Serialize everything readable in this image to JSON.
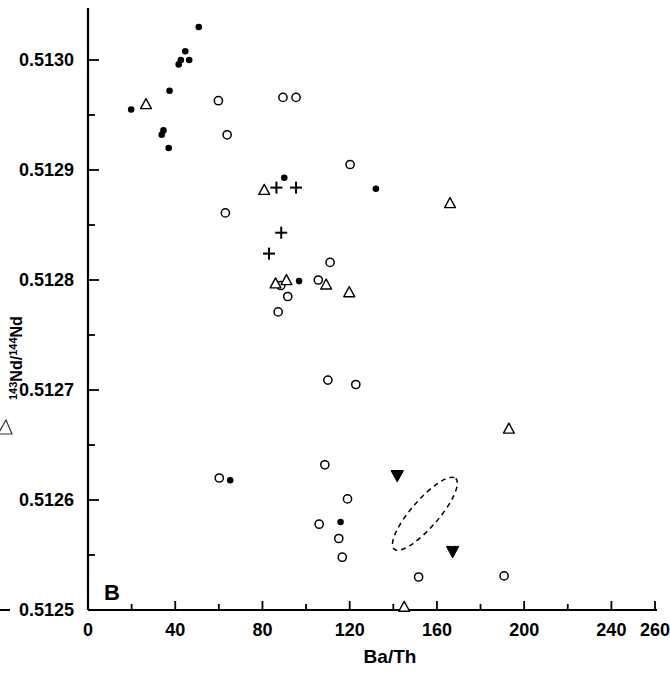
{
  "figure": {
    "panel_label": "B",
    "background_color": "#ffffff",
    "ink_color": "#000000"
  },
  "chart_data": {
    "type": "scatter",
    "title": "",
    "subtitle": "",
    "panel": "B",
    "xlabel": "Ba/Th",
    "ylabel": "143Nd/144Nd",
    "ylabel_parts": {
      "sup1": "143",
      "mid": "Nd/",
      "sup2": "144",
      "end": "Nd"
    },
    "xlim": [
      0,
      260
    ],
    "ylim": [
      0.5125,
      0.51305
    ],
    "grid": false,
    "legend": null,
    "legend_position": "none",
    "xticks": [
      0,
      20,
      40,
      60,
      80,
      100,
      120,
      140,
      160,
      180,
      200,
      220,
      240,
      260
    ],
    "xticklabels": [
      "0",
      "",
      "40",
      "",
      "80",
      "",
      "120",
      "",
      "160",
      "",
      "200",
      "",
      "240",
      "260"
    ],
    "xtick_major": [
      0,
      40,
      80,
      120,
      160,
      200,
      240,
      260
    ],
    "yticks": [
      0.5125,
      0.51255,
      0.5126,
      0.51265,
      0.5127,
      0.51275,
      0.5128,
      0.51285,
      0.5129,
      0.51295,
      0.513
    ],
    "yticklabels": [
      "0.5125",
      "",
      "0.5126",
      "",
      "0.5127",
      "",
      "0.5128",
      "",
      "0.5129",
      "",
      "0.5130"
    ],
    "ytick_major": [
      0.5125,
      0.5126,
      0.5127,
      0.5128,
      0.5129,
      0.513
    ],
    "series": [
      {
        "name": "filled-circle",
        "marker": "filled-circle",
        "points": [
          {
            "x": 19.8,
            "y": 0.512955
          },
          {
            "x": 33.8,
            "y": 0.512932
          },
          {
            "x": 34.6,
            "y": 0.512936
          },
          {
            "x": 37.4,
            "y": 0.512972
          },
          {
            "x": 41.6,
            "y": 0.512996
          },
          {
            "x": 42.6,
            "y": 0.513
          },
          {
            "x": 44.6,
            "y": 0.513008
          },
          {
            "x": 46.4,
            "y": 0.513
          },
          {
            "x": 50.8,
            "y": 0.51303
          },
          {
            "x": 37.0,
            "y": 0.51292
          },
          {
            "x": 65.2,
            "y": 0.512618
          },
          {
            "x": 90.0,
            "y": 0.512893
          },
          {
            "x": 96.8,
            "y": 0.512799
          },
          {
            "x": 132.0,
            "y": 0.512883
          },
          {
            "x": 115.8,
            "y": 0.51258
          }
        ]
      },
      {
        "name": "open-circle",
        "marker": "open-circle",
        "points": [
          {
            "x": 59.8,
            "y": 0.512963
          },
          {
            "x": 63.8,
            "y": 0.512932
          },
          {
            "x": 63.0,
            "y": 0.512861
          },
          {
            "x": 89.4,
            "y": 0.512966
          },
          {
            "x": 95.4,
            "y": 0.512966
          },
          {
            "x": 120.2,
            "y": 0.512905
          },
          {
            "x": 105.6,
            "y": 0.5128
          },
          {
            "x": 111.0,
            "y": 0.512816
          },
          {
            "x": 88.4,
            "y": 0.512795
          },
          {
            "x": 87.2,
            "y": 0.512771
          },
          {
            "x": 91.6,
            "y": 0.512785
          },
          {
            "x": 110.0,
            "y": 0.512709
          },
          {
            "x": 122.8,
            "y": 0.512705
          },
          {
            "x": 60.2,
            "y": 0.51262
          },
          {
            "x": 108.6,
            "y": 0.512632
          },
          {
            "x": 119.0,
            "y": 0.512601
          },
          {
            "x": 106.0,
            "y": 0.512578
          },
          {
            "x": 115.0,
            "y": 0.512565
          },
          {
            "x": 116.6,
            "y": 0.512548
          },
          {
            "x": 151.6,
            "y": 0.51253
          },
          {
            "x": 190.8,
            "y": 0.512531
          }
        ]
      },
      {
        "name": "open-triangle",
        "marker": "open-triangle",
        "points": [
          {
            "x": 26.6,
            "y": 0.51296
          },
          {
            "x": 80.8,
            "y": 0.512882
          },
          {
            "x": 86.0,
            "y": 0.512797
          },
          {
            "x": 91.0,
            "y": 0.5128
          },
          {
            "x": 109.2,
            "y": 0.512796
          },
          {
            "x": 119.8,
            "y": 0.512789
          },
          {
            "x": 166.0,
            "y": 0.51287
          },
          {
            "x": 193.0,
            "y": 0.512665
          },
          {
            "x": 145.0,
            "y": 0.512503
          }
        ]
      },
      {
        "name": "plus",
        "marker": "plus",
        "points": [
          {
            "x": 86.4,
            "y": 0.512884
          },
          {
            "x": 95.4,
            "y": 0.512884
          },
          {
            "x": 88.6,
            "y": 0.512843
          },
          {
            "x": 83.0,
            "y": 0.512824
          }
        ]
      },
      {
        "name": "filled-down-triangle",
        "marker": "filled-down-triangle",
        "points": [
          {
            "x": 141.8,
            "y": 0.512622
          },
          {
            "x": 167.2,
            "y": 0.512553
          }
        ]
      }
    ],
    "annotations": [
      {
        "type": "dashed-ellipse",
        "cx": 154.5,
        "cy": 0.5125875,
        "rx_units": 21.5,
        "ry_units": 1.25e-05,
        "rotation_deg": -49,
        "style": "dashed",
        "encloses": "filled-down-triangle"
      }
    ]
  }
}
